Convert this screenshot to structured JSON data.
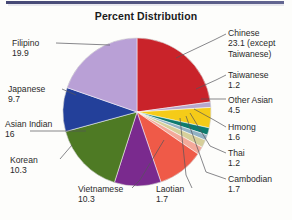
{
  "chart_data": {
    "type": "pie",
    "title": "Percent Distribution",
    "xlabel": "",
    "ylabel": "",
    "legend_position": "callout-labels",
    "grid": false,
    "units": "percent",
    "total": 92.3,
    "categories": [
      "Chinese",
      "Taiwanese",
      "Other Asian",
      "Hmong",
      "Thai",
      "Cambodian",
      "Laotian",
      "Vietnamese",
      "Korean",
      "Asian Indian",
      "Japanese",
      "Filipino"
    ],
    "values": [
      23.1,
      1.2,
      4.5,
      1.6,
      1.2,
      1.7,
      1.7,
      10.3,
      10.3,
      16,
      9.7,
      19.9
    ],
    "colors": [
      "#c9232a",
      "#b7a7cc",
      "#f5cb18",
      "#0e7b6e",
      "#93b2c4",
      "#d6cf9a",
      "#f3a99a",
      "#ef5a48",
      "#7a2a8e",
      "#4e7a24",
      "#23409a",
      "#b9a0d6"
    ],
    "slices": [
      {
        "label": "Chinese",
        "value": 23.1,
        "value_text": "23.1 (except",
        "extra_text": "Taiwanese)",
        "color": "#c9232a"
      },
      {
        "label": "Taiwanese",
        "value": 1.2,
        "value_text": "1.2",
        "color": "#b7a7cc"
      },
      {
        "label": "Other Asian",
        "value": 4.5,
        "value_text": "4.5",
        "color": "#f5cb18"
      },
      {
        "label": "Hmong",
        "value": 1.6,
        "value_text": "1.6",
        "color": "#0e7b6e"
      },
      {
        "label": "Thai",
        "value": 1.2,
        "value_text": "1.2",
        "color": "#93b2c4"
      },
      {
        "label": "Cambodian",
        "value": 1.7,
        "value_text": "1.7",
        "color": "#d6cf9a"
      },
      {
        "label": "Laotian",
        "value": 1.7,
        "value_text": "1.7",
        "color": "#f3a99a"
      },
      {
        "label": "Vietnamese",
        "value": 10.3,
        "value_text": "10.3",
        "color": "#ef5a48"
      },
      {
        "label": "Korean",
        "value": 10.3,
        "value_text": "10.3",
        "color": "#7a2a8e"
      },
      {
        "label": "Asian Indian",
        "value": 16,
        "value_text": "16",
        "color": "#4e7a24"
      },
      {
        "label": "Japanese",
        "value": 9.7,
        "value_text": "9.7",
        "color": "#23409a"
      },
      {
        "label": "Filipino",
        "value": 19.9,
        "value_text": "19.9",
        "color": "#b9a0d6"
      }
    ]
  },
  "labels": {
    "chinese": {
      "name": "Chinese",
      "value": "23.1 (except",
      "extra": "Taiwanese)"
    },
    "taiwanese": {
      "name": "Taiwanese",
      "value": "1.2"
    },
    "other_asian": {
      "name": "Other Asian",
      "value": "4.5"
    },
    "hmong": {
      "name": "Hmong",
      "value": "1.6"
    },
    "thai": {
      "name": "Thai",
      "value": "1.2"
    },
    "cambodian": {
      "name": "Cambodian",
      "value": "1.7"
    },
    "laotian": {
      "name": "Laotian",
      "value": "1.7"
    },
    "vietnamese": {
      "name": "Vietnamese",
      "value": "10.3"
    },
    "korean": {
      "name": "Korean",
      "value": "10.3"
    },
    "asian_indian": {
      "name": "Asian Indian",
      "value": "16"
    },
    "japanese": {
      "name": "Japanese",
      "value": "9.7"
    },
    "filipino": {
      "name": "Filipino",
      "value": "19.9"
    }
  }
}
